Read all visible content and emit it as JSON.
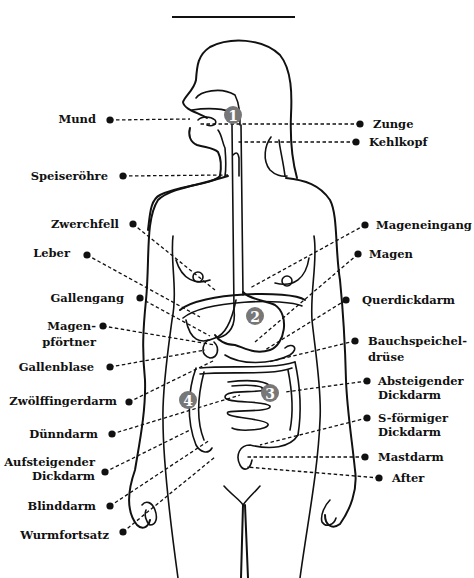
{
  "title_rule": {
    "x1": 172,
    "x2": 295,
    "y": 17
  },
  "badges": [
    {
      "id": "1",
      "label": "1",
      "x": 233,
      "y": 115
    },
    {
      "id": "2",
      "label": "2",
      "x": 255,
      "y": 316
    },
    {
      "id": "3",
      "label": "3",
      "x": 270,
      "y": 393
    },
    {
      "id": "4",
      "label": "4",
      "x": 188,
      "y": 400
    }
  ],
  "labels_left": [
    {
      "id": "mund",
      "lines": [
        "Mund"
      ],
      "text_x": 96,
      "text_y": 123,
      "dot": [
        110,
        120
      ],
      "target": [
        190,
        119
      ]
    },
    {
      "id": "speiseroehre",
      "lines": [
        "Speiseröhre"
      ],
      "text_x": 108,
      "text_y": 180,
      "dot": [
        123,
        176
      ],
      "target": [
        228,
        175
      ]
    },
    {
      "id": "zwerchfell",
      "lines": [
        "Zwerchfell"
      ],
      "text_x": 119,
      "text_y": 228,
      "dot": [
        133,
        224
      ],
      "target": [
        215,
        290
      ]
    },
    {
      "id": "leber",
      "lines": [
        "Leber"
      ],
      "text_x": 70,
      "text_y": 257,
      "dot": [
        87,
        255
      ],
      "target": [
        200,
        317
      ]
    },
    {
      "id": "gallengang",
      "lines": [
        "Gallengang"
      ],
      "text_x": 124,
      "text_y": 302,
      "dot": [
        140,
        298
      ],
      "target": [
        210,
        336
      ]
    },
    {
      "id": "magenpfoertner",
      "lines": [
        "Magen-",
        "pförtner"
      ],
      "text_x": 96,
      "text_y": 330,
      "line_gap": 16,
      "dot": [
        103,
        326
      ],
      "target": [
        215,
        345
      ]
    },
    {
      "id": "gallenblase",
      "lines": [
        "Gallenblase"
      ],
      "text_x": 94,
      "text_y": 371,
      "dot": [
        110,
        367
      ],
      "target": [
        205,
        350
      ]
    },
    {
      "id": "zwoelffingerdarm",
      "lines": [
        "Zwölffingerdarm"
      ],
      "text_x": 117,
      "text_y": 405,
      "dot": [
        129,
        402
      ],
      "target": [
        215,
        360
      ]
    },
    {
      "id": "duenndarm",
      "lines": [
        "Dünndarm"
      ],
      "text_x": 98,
      "text_y": 438,
      "dot": [
        112,
        434
      ],
      "target": [
        240,
        395
      ]
    },
    {
      "id": "aufsteigender-dickdarm",
      "lines": [
        "Aufsteigender",
        "Dickdarm"
      ],
      "text_x": 95,
      "text_y": 466,
      "line_gap": 14,
      "dot": [
        105,
        472
      ],
      "target": [
        190,
        430
      ]
    },
    {
      "id": "blinddarm",
      "lines": [
        "Blinddarm"
      ],
      "text_x": 96,
      "text_y": 510,
      "dot": [
        110,
        506
      ],
      "target": [
        210,
        440
      ]
    },
    {
      "id": "wurmfortsatz",
      "lines": [
        "Wurmfortsatz"
      ],
      "text_x": 109,
      "text_y": 539,
      "dot": [
        123,
        532
      ],
      "target": [
        215,
        457
      ]
    }
  ],
  "labels_right": [
    {
      "id": "zunge",
      "lines": [
        "Zunge"
      ],
      "text_x": 373,
      "text_y": 128,
      "dot": [
        360,
        124
      ],
      "target": [
        200,
        124
      ]
    },
    {
      "id": "kehlkopf",
      "lines": [
        "Kehlkopf"
      ],
      "text_x": 369,
      "text_y": 146,
      "dot": [
        356,
        142
      ],
      "target": [
        238,
        142
      ]
    },
    {
      "id": "mageneingang",
      "lines": [
        "Mageneingang"
      ],
      "text_x": 376,
      "text_y": 229,
      "dot": [
        365,
        225
      ],
      "target": [
        250,
        288
      ]
    },
    {
      "id": "magen",
      "lines": [
        "Magen"
      ],
      "text_x": 369,
      "text_y": 258,
      "dot": [
        358,
        254
      ],
      "target": [
        255,
        342
      ]
    },
    {
      "id": "querdickdarm",
      "lines": [
        "Querdickdarm"
      ],
      "text_x": 362,
      "text_y": 304,
      "dot": [
        346,
        300
      ],
      "target": [
        265,
        350
      ]
    },
    {
      "id": "bauchspeicheldruese",
      "lines": [
        "Bauchspeichel-",
        "drüse"
      ],
      "text_x": 368,
      "text_y": 345,
      "line_gap": 16,
      "dot": [
        355,
        341
      ],
      "target": [
        268,
        362
      ]
    },
    {
      "id": "absteigender-dickdarm",
      "lines": [
        "Absteigender",
        "Dickdarm"
      ],
      "text_x": 378,
      "text_y": 385,
      "line_gap": 14,
      "dot": [
        367,
        381
      ],
      "target": [
        285,
        392
      ]
    },
    {
      "id": "s-foermiger-dickdarm",
      "lines": [
        "S-förmiger",
        "Dickdarm"
      ],
      "text_x": 378,
      "text_y": 422,
      "line_gap": 14,
      "dot": [
        367,
        418
      ],
      "target": [
        260,
        445
      ]
    },
    {
      "id": "mastdarm",
      "lines": [
        "Mastdarm"
      ],
      "text_x": 378,
      "text_y": 461,
      "dot": [
        365,
        457
      ],
      "target": [
        245,
        457
      ]
    },
    {
      "id": "after",
      "lines": [
        "After"
      ],
      "text_x": 392,
      "text_y": 482,
      "dot": [
        379,
        478
      ],
      "target": [
        247,
        467
      ]
    }
  ]
}
